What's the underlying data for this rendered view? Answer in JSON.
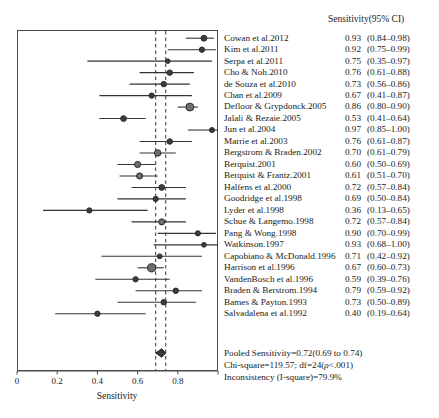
{
  "header": {
    "sensitivity_column": "Sensitivity(95% CI)"
  },
  "axis": {
    "title": "Sensitivity",
    "ticks": [
      "0",
      "0.2",
      "0.4",
      "0.6",
      "0.8"
    ],
    "tick_values": [
      0,
      0.2,
      0.4,
      0.6,
      0.8
    ],
    "xmin": 0,
    "xmax": 1.0
  },
  "footer": {
    "pooled": "Pooled Sensitivity=0.72(0.69 to 0.74)",
    "chisq_prefix": "Chi-square=119.57;  df=24(",
    "chisq_rho": "ρ",
    "chisq_suffix": "<.001)",
    "inconsistency": "Inconsistency (I-square)=79.9%"
  },
  "chart_data": {
    "type": "forest",
    "title": "",
    "xlabel": "Sensitivity",
    "ylabel": "",
    "xlim": [
      0,
      1.0
    ],
    "grid": false,
    "legend": "none",
    "value_label": "Sensitivity(95% CI)",
    "reference_lines": [
      0.69,
      0.74
    ],
    "pooled": {
      "label": "Pooled Sensitivity",
      "estimate": 0.72,
      "ci_low": 0.69,
      "ci_high": 0.74,
      "text": "Pooled Sensitivity=0.72(0.69 to 0.74)"
    },
    "heterogeneity": {
      "chi_square": 119.57,
      "df": 24,
      "p": "<.001",
      "i_square_percent": 79.9
    },
    "studies": [
      {
        "label": "Cowan et al.2012",
        "value": "0.93",
        "ci": "(0.84–0.98)",
        "est": 0.93,
        "low": 0.84,
        "high": 0.98,
        "weight": 2.0
      },
      {
        "label": "Kim et al.2011",
        "value": "0.92",
        "ci": "(0.75–0.99)",
        "est": 0.92,
        "low": 0.75,
        "high": 0.99,
        "weight": 1.6
      },
      {
        "label": "Serpa et al.2011",
        "value": "0.75",
        "ci": "(0.35–0.97)",
        "est": 0.75,
        "low": 0.35,
        "high": 0.97,
        "weight": 1.1
      },
      {
        "label": "Cho & Noh.2010",
        "value": "0.76",
        "ci": "(0.61–0.88)",
        "est": 0.76,
        "low": 0.61,
        "high": 0.88,
        "weight": 1.7
      },
      {
        "label": "de Souza et al.2010",
        "value": "0.73",
        "ci": "(0.56–0.86)",
        "est": 0.73,
        "low": 0.56,
        "high": 0.86,
        "weight": 1.7
      },
      {
        "label": "Chan et al.2009",
        "value": "0.67",
        "ci": "(0.41–0.87)",
        "est": 0.67,
        "low": 0.41,
        "high": 0.87,
        "weight": 1.6
      },
      {
        "label": "Defloor & Grypdonck.2005",
        "value": "0.86",
        "ci": "(0.80–0.90)",
        "est": 0.86,
        "low": 0.8,
        "high": 0.9,
        "weight": 3.4
      },
      {
        "label": "Jalali & Rezaie.2005",
        "value": "0.53",
        "ci": "(0.41–0.64)",
        "est": 0.53,
        "low": 0.41,
        "high": 0.64,
        "weight": 1.9
      },
      {
        "label": "Jun et al.2004",
        "value": "0.97",
        "ci": "(0.85–1.00)",
        "est": 0.97,
        "low": 0.85,
        "high": 1.0,
        "weight": 1.4
      },
      {
        "label": "Marrie et al.2003",
        "value": "0.76",
        "ci": "(0.61–0.87)",
        "est": 0.76,
        "low": 0.61,
        "high": 0.87,
        "weight": 1.7
      },
      {
        "label": "Bergstrom & Braden.2002",
        "value": "0.70",
        "ci": "(0.61–0.79)",
        "est": 0.7,
        "low": 0.61,
        "high": 0.79,
        "weight": 2.4
      },
      {
        "label": "Berquist.2001",
        "value": "0.60",
        "ci": "(0.50–0.69)",
        "est": 0.6,
        "low": 0.5,
        "high": 0.69,
        "weight": 2.2
      },
      {
        "label": "Berquist & Frantz.2001",
        "value": "0.61",
        "ci": "(0.51–0.70)",
        "est": 0.61,
        "low": 0.51,
        "high": 0.7,
        "weight": 2.2
      },
      {
        "label": "Halfens et al.2000",
        "value": "0.72",
        "ci": "(0.57–0.84)",
        "est": 0.72,
        "low": 0.57,
        "high": 0.84,
        "weight": 1.9
      },
      {
        "label": "Goodridge et al.1998",
        "value": "0.69",
        "ci": "(0.50–0.84)",
        "est": 0.69,
        "low": 0.5,
        "high": 0.84,
        "weight": 1.5
      },
      {
        "label": "Lyder et al.1998",
        "value": "0.36",
        "ci": "(0.13–0.65)",
        "est": 0.36,
        "low": 0.13,
        "high": 0.65,
        "weight": 1.5
      },
      {
        "label": "Schue & Langemo.1998",
        "value": "0.72",
        "ci": "(0.57–0.84)",
        "est": 0.72,
        "low": 0.57,
        "high": 0.84,
        "weight": 2.1
      },
      {
        "label": "Pang & Wong.1998",
        "value": "0.90",
        "ci": "(0.70–0.99)",
        "est": 0.9,
        "low": 0.7,
        "high": 0.99,
        "weight": 1.5
      },
      {
        "label": "Watkinson.1997",
        "value": "0.93",
        "ci": "(0.68–1.00)",
        "est": 0.93,
        "low": 0.68,
        "high": 1.0,
        "weight": 1.2
      },
      {
        "label": "Capobiano & McDonald.1996",
        "value": "0.71",
        "ci": "(0.42–0.92)",
        "est": 0.71,
        "low": 0.42,
        "high": 0.92,
        "weight": 1.3
      },
      {
        "label": "Harrison et al.1996",
        "value": "0.67",
        "ci": "(0.60–0.73)",
        "est": 0.67,
        "low": 0.6,
        "high": 0.73,
        "weight": 3.6
      },
      {
        "label": "VandenBosch et al.1996",
        "value": "0.59",
        "ci": "(0.39–0.76)",
        "est": 0.59,
        "low": 0.39,
        "high": 0.76,
        "weight": 1.6
      },
      {
        "label": "Braden & Berstrom.1994",
        "value": "0.79",
        "ci": "(0.59–0.92)",
        "est": 0.79,
        "low": 0.59,
        "high": 0.92,
        "weight": 1.7
      },
      {
        "label": "Bames & Payton.1993",
        "value": "0.73",
        "ci": "(0.50–0.89)",
        "est": 0.73,
        "low": 0.5,
        "high": 0.89,
        "weight": 1.7
      },
      {
        "label": "Salvadalena et al.1992",
        "value": "0.40",
        "ci": "(0.19–0.64)",
        "est": 0.4,
        "low": 0.19,
        "high": 0.64,
        "weight": 1.6
      }
    ]
  },
  "colors": {
    "marker": "#3c3c3c",
    "marker_fill": "#6e6e6e",
    "line": "#333333",
    "frame": "#4a4a4a",
    "reference": "#333333"
  }
}
